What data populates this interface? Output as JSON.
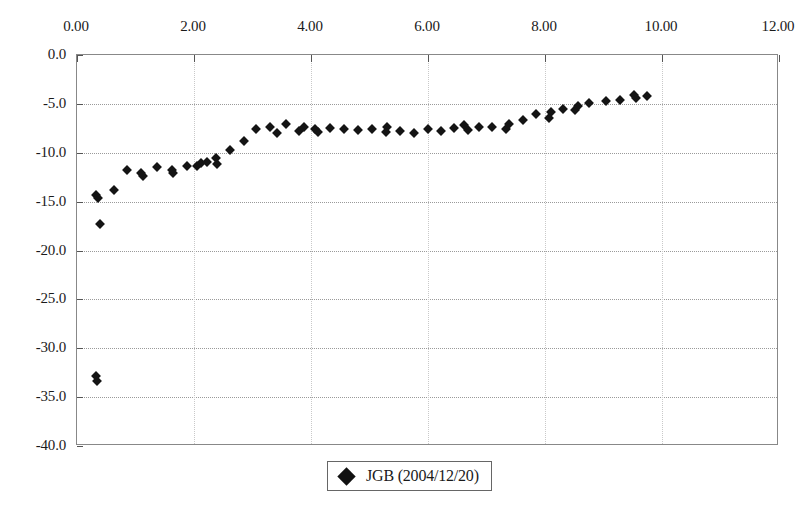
{
  "chart_data": {
    "type": "scatter",
    "title": "",
    "subtitle": "",
    "xlabel": "",
    "ylabel": "",
    "xlim": [
      0.0,
      12.0
    ],
    "ylim": [
      -40.0,
      0.0
    ],
    "x_tick_labels": [
      "0.00",
      "2.00",
      "4.00",
      "6.00",
      "8.00",
      "10.00",
      "12.00"
    ],
    "x_ticks": [
      0.0,
      2.0,
      4.0,
      6.0,
      8.0,
      10.0,
      12.0
    ],
    "y_tick_labels": [
      "0.0",
      "-5.0",
      "-10.0",
      "-15.0",
      "-20.0",
      "-25.0",
      "-30.0",
      "-35.0",
      "-40.0"
    ],
    "y_ticks": [
      0.0,
      -5.0,
      -10.0,
      -15.0,
      -20.0,
      -25.0,
      -30.0,
      -35.0,
      -40.0
    ],
    "x_axis_position": "top",
    "grid": true,
    "grid_axis": "y",
    "legend_position": "bottom-center",
    "marker": "diamond",
    "marker_color": "#141414",
    "series": [
      {
        "name": "JGB (2004/12/20)",
        "points": [
          [
            0.33,
            -14.3
          ],
          [
            0.36,
            -14.6
          ],
          [
            0.4,
            -17.3
          ],
          [
            0.33,
            -32.8
          ],
          [
            0.35,
            -33.4
          ],
          [
            0.63,
            -13.8
          ],
          [
            0.86,
            -11.8
          ],
          [
            1.1,
            -12.1
          ],
          [
            1.13,
            -12.4
          ],
          [
            1.37,
            -11.5
          ],
          [
            1.62,
            -11.8
          ],
          [
            1.64,
            -12.1
          ],
          [
            1.88,
            -11.4
          ],
          [
            2.05,
            -11.4
          ],
          [
            2.12,
            -11.0
          ],
          [
            2.22,
            -10.9
          ],
          [
            2.38,
            -10.5
          ],
          [
            2.4,
            -11.1
          ],
          [
            2.62,
            -9.7
          ],
          [
            2.86,
            -8.8
          ],
          [
            3.06,
            -7.6
          ],
          [
            3.3,
            -7.4
          ],
          [
            3.42,
            -8.0
          ],
          [
            3.58,
            -7.1
          ],
          [
            3.8,
            -7.8
          ],
          [
            3.88,
            -7.4
          ],
          [
            4.06,
            -7.6
          ],
          [
            4.12,
            -7.9
          ],
          [
            4.32,
            -7.5
          ],
          [
            4.56,
            -7.6
          ],
          [
            4.8,
            -7.7
          ],
          [
            5.05,
            -7.6
          ],
          [
            5.28,
            -7.9
          ],
          [
            5.3,
            -7.4
          ],
          [
            5.52,
            -7.8
          ],
          [
            5.76,
            -8.0
          ],
          [
            6.0,
            -7.6
          ],
          [
            6.22,
            -7.8
          ],
          [
            6.44,
            -7.5
          ],
          [
            6.62,
            -7.2
          ],
          [
            6.68,
            -7.7
          ],
          [
            6.88,
            -7.4
          ],
          [
            7.1,
            -7.4
          ],
          [
            7.34,
            -7.6
          ],
          [
            7.38,
            -7.1
          ],
          [
            7.62,
            -6.6
          ],
          [
            7.84,
            -6.0
          ],
          [
            8.06,
            -6.4
          ],
          [
            8.1,
            -5.8
          ],
          [
            8.3,
            -5.5
          ],
          [
            8.52,
            -5.6
          ],
          [
            8.56,
            -5.2
          ],
          [
            8.76,
            -4.9
          ],
          [
            9.04,
            -4.7
          ],
          [
            9.28,
            -4.6
          ],
          [
            9.52,
            -4.1
          ],
          [
            9.55,
            -4.4
          ],
          [
            9.74,
            -4.2
          ]
        ]
      }
    ]
  },
  "legend": {
    "label": "JGB (2004/12/20)",
    "marker_name": "diamond-marker"
  }
}
